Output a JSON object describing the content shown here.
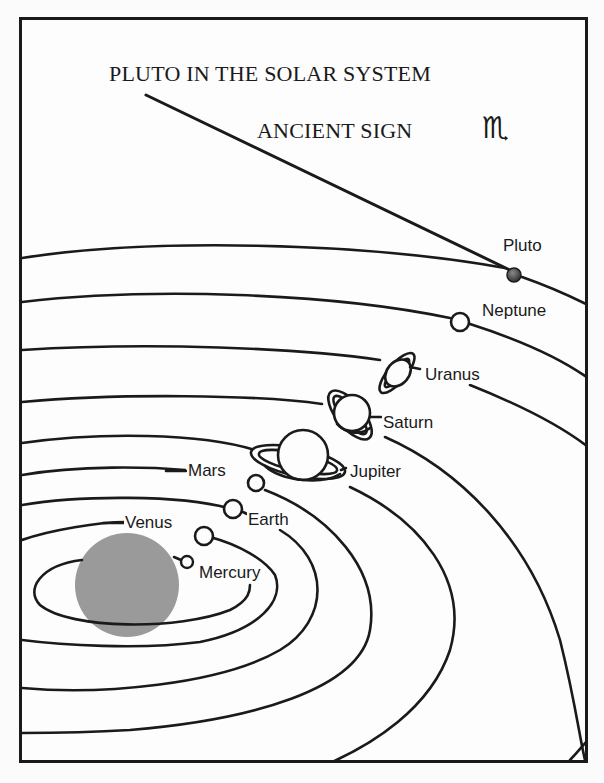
{
  "title": "PLUTO IN THE SOLAR SYSTEM",
  "subtitle": "ANCIENT SIGN",
  "sign_glyph": "♏",
  "sign_name": "scorpio-sign-icon",
  "sun": {
    "color": "#9a9a9a"
  },
  "planets": [
    {
      "name": "Mercury",
      "label": "Mercury"
    },
    {
      "name": "Venus",
      "label": "Venus"
    },
    {
      "name": "Earth",
      "label": "Earth"
    },
    {
      "name": "Mars",
      "label": "Mars"
    },
    {
      "name": "Jupiter",
      "label": "Jupiter"
    },
    {
      "name": "Saturn",
      "label": "Saturn"
    },
    {
      "name": "Uranus",
      "label": "Uranus"
    },
    {
      "name": "Neptune",
      "label": "Neptune"
    },
    {
      "name": "Pluto",
      "label": "Pluto"
    }
  ],
  "colors": {
    "ink": "#1a1a1a",
    "paper": "#fdfdfd",
    "pluto": "#555555"
  }
}
